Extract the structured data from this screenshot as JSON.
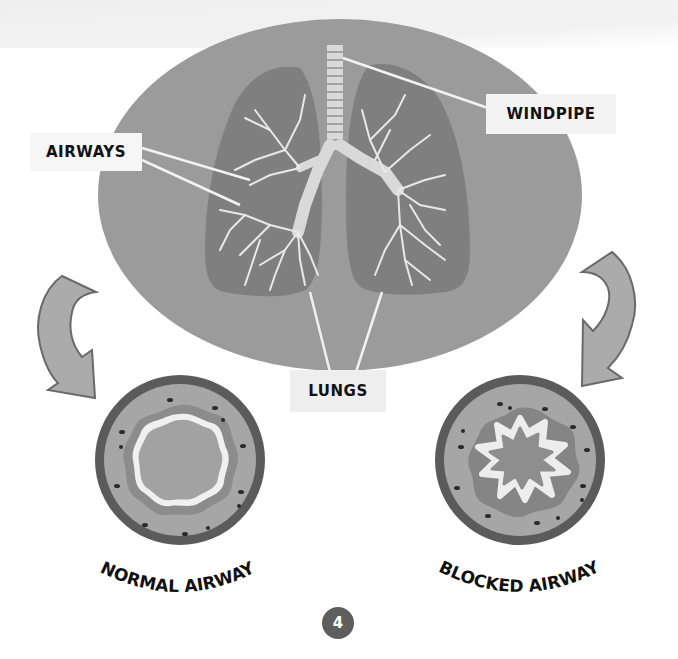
{
  "labels": {
    "airways": "AIRWAYS",
    "windpipe": "WINDPIPE",
    "lungs": "LUNGS"
  },
  "captions": {
    "normal": "NORMAL AIRWAY",
    "blocked": "BLOCKED AIRWAY"
  },
  "page_number": "4",
  "colors": {
    "oval": "#9a9a9a",
    "lung": "#7e7e7e",
    "branch": "#e6e6e6",
    "airway_outer_ring": "#5a5a5a",
    "airway_wall": "#a8a8a8",
    "arrow": "#ababab",
    "badge": "#5e5e5e"
  },
  "icons": {
    "left_arrow": "curved-arrow-down-left",
    "right_arrow": "curved-arrow-down-right"
  }
}
